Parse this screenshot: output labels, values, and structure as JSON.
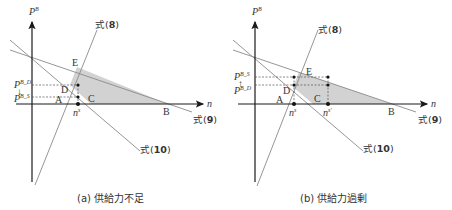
{
  "panels": [
    {
      "id": "a",
      "caption": "(a) 供給力不足",
      "axes": {
        "y_label": "P",
        "y_label_sup": "B",
        "x_label": "n"
      },
      "points": {
        "A": "A",
        "B": "B",
        "C": "C",
        "D": "D",
        "E": "E"
      },
      "price_labels": [
        {
          "base": "P",
          "sup": "B_D",
          "position": "upper"
        },
        {
          "base": "P",
          "sup": "B_S",
          "position": "lower"
        }
      ],
      "n_labels": [
        {
          "base": "n",
          "sup": "s"
        }
      ],
      "equations": {
        "eq8": {
          "prefix": "式",
          "num": "8"
        },
        "eq9": {
          "prefix": "式",
          "num": "9"
        },
        "eq10": {
          "prefix": "式",
          "num": "10"
        }
      },
      "arrow": "↓"
    },
    {
      "id": "b",
      "caption": "(b) 供給力過剰",
      "axes": {
        "y_label": "P",
        "y_label_sup": "B",
        "x_label": "n"
      },
      "points": {
        "A": "A",
        "B": "B",
        "C": "C",
        "D": "D",
        "E": "E"
      },
      "price_labels": [
        {
          "base": "P",
          "sup": "B_S",
          "position": "upper"
        },
        {
          "base": "P",
          "sup": "B_D",
          "position": "lower"
        }
      ],
      "n_labels": [
        {
          "base": "n",
          "sup": "s"
        },
        {
          "base": "n",
          "sup": "s'"
        }
      ],
      "equations": {
        "eq8": {
          "prefix": "式",
          "num": "8"
        },
        "eq9": {
          "prefix": "式",
          "num": "9"
        },
        "eq10": {
          "prefix": "式",
          "num": "10"
        }
      },
      "arrow": "↑"
    }
  ],
  "colors": {
    "axis": "#1a1a1a",
    "line": "#8a8a8a",
    "shade": "#cfcfcf",
    "dash": "#555555",
    "dot": "#111111"
  }
}
